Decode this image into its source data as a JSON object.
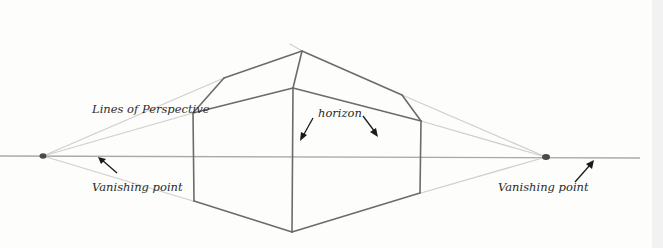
{
  "labels": {
    "lines_of_perspective": "Lines of Perspective",
    "horizon": "horizon",
    "vanishing_point_left": "Vanishing point",
    "vanishing_point_right": "Vanishing point"
  },
  "geometry": {
    "horizon_y": 156,
    "vanishing_points": [
      {
        "name": "left",
        "x": 43,
        "y": 156
      },
      {
        "name": "right",
        "x": 546,
        "y": 157
      }
    ],
    "vertical_edges": [
      {
        "name": "left-wall-edge",
        "x": 193,
        "top": 113,
        "bottom": 201
      },
      {
        "name": "front-corner-edge",
        "x": 293,
        "top": 88,
        "bottom": 232
      },
      {
        "name": "right-wall-edge",
        "x": 421,
        "top": 121,
        "bottom": 193
      }
    ],
    "roof": {
      "left": {
        "x": 224,
        "y": 78
      },
      "peak": {
        "x": 302,
        "y": 51
      },
      "right": {
        "x": 402,
        "y": 95
      }
    }
  },
  "colors": {
    "pencil_dark": "#6b6b6b",
    "pencil_light": "#cfcfcf",
    "text": "#2a2a2a",
    "background": "#fdfdfc"
  }
}
